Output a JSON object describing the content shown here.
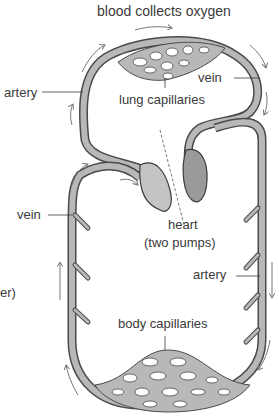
{
  "diagram": {
    "labels": {
      "top": "blood collects oxygen",
      "artery_left": "artery",
      "vein_top": "vein",
      "lung_capillaries": "lung capillaries",
      "vein_left": "vein",
      "heart": "heart",
      "heart_sub": "(two pumps)",
      "artery_right": "artery",
      "body_capillaries": "body capillaries",
      "cut_off": "er)"
    },
    "colors": {
      "vessel_fill": "#b8b8b8",
      "vessel_stroke": "#4a4a4a",
      "heart_left": "#c4c4c4",
      "heart_right": "#9a9a9a",
      "arrow": "#777777",
      "text": "#3a3a3a"
    }
  }
}
